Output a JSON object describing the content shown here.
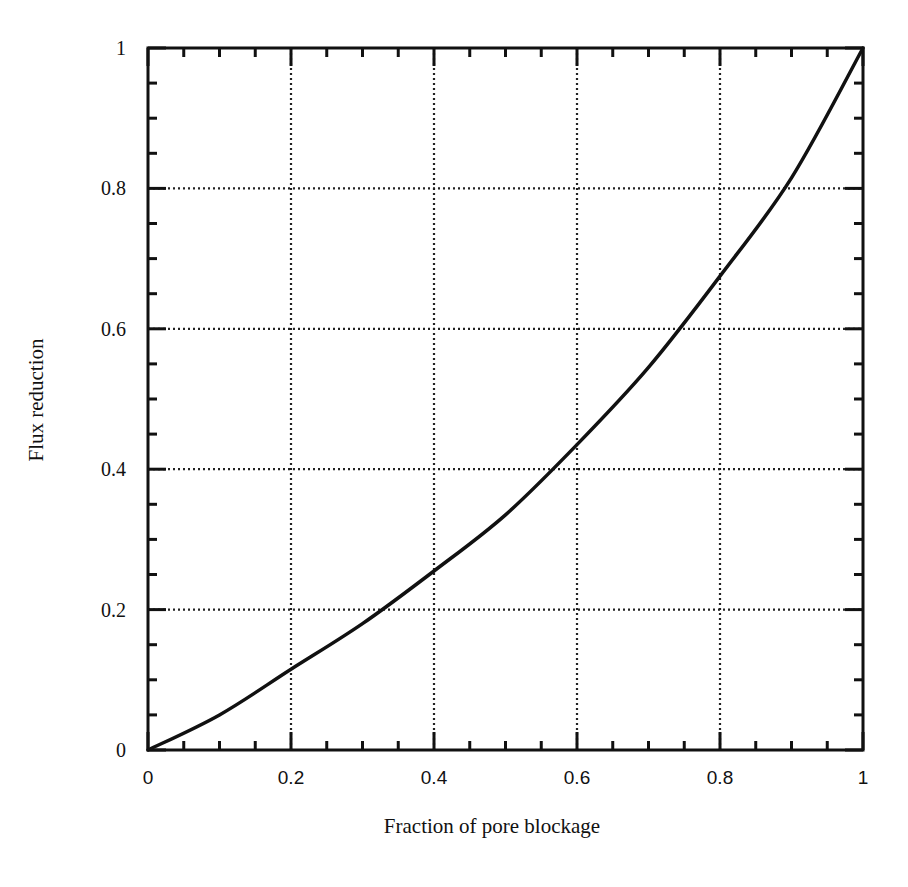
{
  "chart_data": {
    "type": "line",
    "title": "",
    "xlabel": "Fraction of pore blockage",
    "ylabel": "Flux reduction",
    "xlim": [
      0,
      1
    ],
    "ylim": [
      0,
      1
    ],
    "grid": true,
    "grid_style": "dotted",
    "legend": null,
    "x_ticks": [
      0,
      0.2,
      0.4,
      0.6,
      0.8,
      1
    ],
    "x_tick_labels": [
      "0",
      "0.2",
      "0.4",
      "0.6",
      "0.8",
      "1"
    ],
    "y_ticks": [
      0,
      0.2,
      0.4,
      0.6,
      0.8,
      1
    ],
    "y_tick_labels": [
      "0",
      "0.2",
      "0.4",
      "0.6",
      "0.8",
      "1"
    ],
    "minor_ticks_per_interval": 3,
    "series": [
      {
        "name": "Flux reduction",
        "x": [
          0,
          0.1,
          0.2,
          0.3,
          0.4,
          0.5,
          0.6,
          0.7,
          0.8,
          0.9,
          1.0
        ],
        "values": [
          0,
          0.05,
          0.115,
          0.18,
          0.255,
          0.335,
          0.435,
          0.545,
          0.675,
          0.815,
          1.0
        ],
        "color": "#111111"
      }
    ]
  },
  "layout": {
    "plot_left": 148,
    "plot_right": 863,
    "plot_top": 48,
    "plot_bottom": 750
  }
}
